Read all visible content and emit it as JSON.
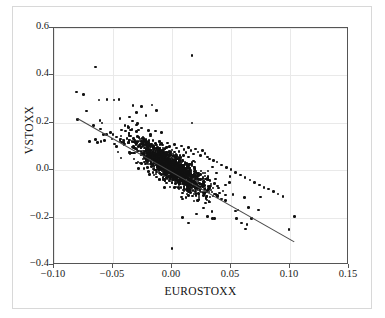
{
  "figure": {
    "background": "#ffffff",
    "frame_color": "#555555",
    "grid_color": "#e9e9e9",
    "point_color": "#111111",
    "line_color": "#4a4a4a"
  },
  "chart_data": {
    "type": "scatter",
    "title": "",
    "xlabel": "EUROSTOXX",
    "ylabel": "VSTOXX",
    "xlim": [
      -0.1,
      0.15
    ],
    "ylim": [
      -0.4,
      0.6
    ],
    "xticks": [
      -0.1,
      -0.05,
      0.0,
      0.05,
      0.1,
      0.15
    ],
    "xticklabels": [
      "−0.10",
      "−0.05",
      "0.00",
      "0.05",
      "0.10",
      "0.15"
    ],
    "yticks": [
      -0.4,
      -0.2,
      0.0,
      0.2,
      0.4,
      0.6
    ],
    "yticklabels": [
      "−0.4",
      "−0.2",
      "0.0",
      "0.2",
      "0.4",
      "0.6"
    ],
    "grid": true,
    "legend": null,
    "marker": "filled-circle",
    "correlation": "negative",
    "fit_line": {
      "type": "linear-regression",
      "x_start": -0.08,
      "y_start": 0.215,
      "x_end": 0.105,
      "y_end": -0.31,
      "slope": -2.84,
      "intercept": -0.012
    },
    "notable_outliers": [
      {
        "x": 0.017,
        "y": 0.485
      },
      {
        "x": -0.065,
        "y": 0.435
      },
      {
        "x": -0.081,
        "y": 0.33
      },
      {
        "x": -0.075,
        "y": 0.32
      },
      {
        "x": 0.0,
        "y": -0.33
      },
      {
        "x": 0.017,
        "y": 0.2
      },
      {
        "x": 0.104,
        "y": -0.195
      },
      {
        "x": 0.099,
        "y": -0.25
      }
    ],
    "points": [
      [
        0.017,
        0.485
      ],
      [
        -0.065,
        0.435
      ],
      [
        -0.081,
        0.33
      ],
      [
        -0.075,
        0.32
      ],
      [
        -0.062,
        0.297
      ],
      [
        -0.055,
        0.298
      ],
      [
        -0.049,
        0.297
      ],
      [
        -0.045,
        0.298
      ],
      [
        -0.033,
        0.272
      ],
      [
        -0.026,
        0.268
      ],
      [
        -0.017,
        0.275
      ],
      [
        -0.013,
        0.252
      ],
      [
        -0.03,
        0.243
      ],
      [
        -0.022,
        0.232
      ],
      [
        -0.036,
        0.225
      ],
      [
        -0.08,
        0.215
      ],
      [
        -0.061,
        0.21
      ],
      [
        0.017,
        0.2
      ],
      [
        -0.029,
        0.196
      ],
      [
        -0.04,
        0.188
      ],
      [
        -0.037,
        0.18
      ],
      [
        -0.043,
        0.17
      ],
      [
        -0.034,
        0.172
      ],
      [
        -0.026,
        0.178
      ],
      [
        -0.02,
        0.168
      ],
      [
        -0.014,
        0.165
      ],
      [
        -0.009,
        0.158
      ],
      [
        -0.052,
        0.16
      ],
      [
        -0.058,
        0.15
      ],
      [
        -0.065,
        0.13
      ],
      [
        -0.07,
        0.122
      ],
      [
        -0.063,
        0.118
      ],
      [
        -0.057,
        0.125
      ],
      [
        -0.051,
        0.132
      ],
      [
        -0.047,
        0.14
      ],
      [
        -0.044,
        0.128
      ],
      [
        -0.041,
        0.118
      ],
      [
        -0.038,
        0.135
      ],
      [
        -0.035,
        0.145
      ],
      [
        -0.032,
        0.128
      ],
      [
        -0.03,
        0.115
      ],
      [
        -0.028,
        0.138
      ],
      [
        -0.026,
        0.122
      ],
      [
        -0.024,
        0.108
      ],
      [
        -0.022,
        0.13
      ],
      [
        -0.02,
        0.118
      ],
      [
        -0.018,
        0.104
      ],
      [
        -0.016,
        0.126
      ],
      [
        -0.014,
        0.112
      ],
      [
        -0.012,
        0.098
      ],
      [
        -0.01,
        0.12
      ],
      [
        -0.008,
        0.106
      ],
      [
        -0.006,
        0.092
      ],
      [
        -0.004,
        0.114
      ],
      [
        -0.002,
        0.1
      ],
      [
        0.0,
        0.086
      ],
      [
        0.002,
        0.108
      ],
      [
        0.004,
        0.094
      ],
      [
        0.006,
        0.08
      ],
      [
        0.008,
        0.102
      ],
      [
        0.01,
        0.088
      ],
      [
        0.012,
        0.074
      ],
      [
        0.014,
        0.096
      ],
      [
        0.016,
        0.082
      ],
      [
        0.018,
        0.068
      ],
      [
        0.02,
        0.09
      ],
      [
        0.022,
        0.076
      ],
      [
        0.024,
        0.062
      ],
      [
        0.026,
        0.084
      ],
      [
        0.028,
        0.07
      ],
      [
        0.03,
        0.056
      ],
      [
        0.032,
        0.048
      ],
      [
        0.035,
        0.04
      ],
      [
        0.038,
        0.035
      ],
      [
        0.042,
        0.022
      ],
      [
        0.046,
        0.012
      ],
      [
        0.05,
        0.002
      ],
      [
        0.054,
        -0.01
      ],
      [
        0.058,
        -0.02
      ],
      [
        0.062,
        -0.032
      ],
      [
        0.066,
        -0.042
      ],
      [
        0.07,
        -0.052
      ],
      [
        0.074,
        -0.062
      ],
      [
        0.078,
        -0.072
      ],
      [
        0.082,
        -0.08
      ],
      [
        0.086,
        -0.09
      ],
      [
        0.09,
        -0.1
      ],
      [
        0.094,
        -0.112
      ],
      [
        0.099,
        -0.25
      ],
      [
        0.104,
        -0.195
      ],
      [
        0.0,
        -0.33
      ],
      [
        0.059,
        -0.222
      ],
      [
        0.036,
        -0.205
      ],
      [
        0.03,
        -0.195
      ],
      [
        0.021,
        -0.185
      ],
      [
        0.014,
        -0.222
      ],
      [
        0.009,
        -0.2
      ]
    ],
    "n_points": "approximately 1500",
    "cluster_center": [
      0.0,
      0.01
    ]
  }
}
